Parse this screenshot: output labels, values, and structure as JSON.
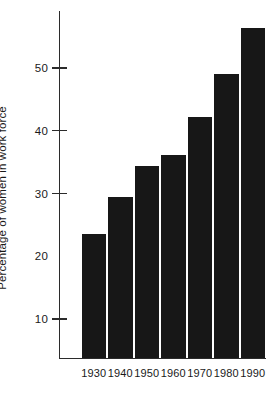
{
  "chart_data": {
    "type": "bar",
    "title": "",
    "subtitle": "",
    "xlabel": "",
    "ylabel": "Percentage of women in work force",
    "categories": [
      "1930",
      "1940",
      "1950",
      "1960",
      "1970",
      "1980",
      "1990"
    ],
    "values": [
      23.5,
      29.4,
      34.4,
      36.1,
      42.2,
      49.1,
      56.3
    ],
    "series": [
      {
        "name": "Percentage of women in work force",
        "values": [
          23.5,
          29.4,
          34.4,
          36.1,
          42.2,
          49.1,
          56.3
        ]
      }
    ],
    "ylim": [
      3.8,
      59.5
    ],
    "xlim": [
      0,
      7
    ],
    "y_ticks": [
      10,
      20,
      30,
      40,
      50
    ],
    "y_tick_labels": [
      "10",
      "20",
      "30",
      "40",
      "50"
    ],
    "x_tick_labels": [
      "1930",
      "1940",
      "1950",
      "1960",
      "1970",
      "1980",
      "1990"
    ],
    "grid": false,
    "legend": false,
    "legend_position": "none",
    "bar_color": "#171717",
    "axis_color": "#2b2b2b",
    "text_color": "#1a1a1a",
    "background_color": "#ffffff",
    "annotations": []
  },
  "axis": {
    "y_title": "Percentage of women in work force",
    "ticks": [
      {
        "value": 50,
        "label": "50",
        "tick_visible": true
      },
      {
        "value": 40,
        "label": "40",
        "tick_visible": true
      },
      {
        "value": 30,
        "label": "30",
        "tick_visible": true
      },
      {
        "value": 20,
        "label": "20",
        "tick_visible": false
      },
      {
        "value": 10,
        "label": "10",
        "tick_visible": true
      }
    ]
  }
}
